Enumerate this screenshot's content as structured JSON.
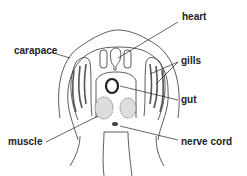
{
  "diagram": {
    "labels": {
      "heart": "heart",
      "carapace": "carapace",
      "gills": "gills",
      "gut": "gut",
      "muscle": "muscle",
      "nerve_cord": "nerve cord"
    },
    "colors": {
      "line": "#333333",
      "stipple": "#999999",
      "background": "#ffffff"
    }
  }
}
